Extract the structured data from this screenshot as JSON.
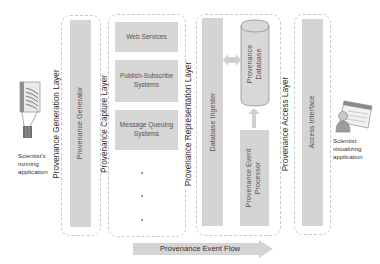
{
  "diagram": {
    "left_actor": {
      "label_lines": [
        "Scientist's",
        "running",
        "application"
      ],
      "icon": "running-application-icon"
    },
    "right_actor": {
      "label_lines": [
        "Scientist",
        "visualizing",
        "application"
      ],
      "icon": "scientist-visualizing-icon"
    },
    "layers": [
      {
        "name": "Provenance Generation Layer",
        "components": [
          "Provenance Generator"
        ]
      },
      {
        "name": "Provenance Capture Layer",
        "components": [
          "Web Services",
          "Publish-Subscribe Systems",
          "Message Queuing Systems"
        ],
        "more_indicator": "..."
      },
      {
        "name": "Provenance Representation Layer",
        "components": [
          "Database Ingester",
          "Provenance Database",
          "Provenance Event Processor"
        ]
      },
      {
        "name": "Provenance Access Layer",
        "components": [
          "Access Interface"
        ]
      }
    ],
    "capture_boxes": {
      "web_services": "Web Services",
      "pubsub_line1": "Publish-Subscribe",
      "pubsub_line2": "Systems",
      "mq_line1": "Message Queuing",
      "mq_line2": "Systems"
    },
    "representation": {
      "ingester": "Database Ingester",
      "db_line1": "Provenance",
      "db_line2": "Database",
      "proc_line1": "Provenance Event",
      "proc_line2": "Processor"
    },
    "flow_arrow_label": "Provenance Event Flow",
    "colors": {
      "component_fill": "#d4d4d4",
      "dashed_border": "#c9c9c9",
      "text": "#333333"
    }
  }
}
